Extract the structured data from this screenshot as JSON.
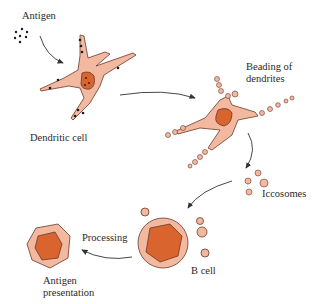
{
  "labels": {
    "antigen": "Antigen",
    "dendritic_cell": "Dendritic cell",
    "beading_line1": "Beading of",
    "beading_line2": "dendrites",
    "iccosomes": "Iccosomes",
    "b_cell": "B cell",
    "processing": "Processing",
    "antigen_presentation_line1": "Antigen",
    "antigen_presentation_line2": "presentation"
  },
  "colors": {
    "cytoplasm": "#f2b8a0",
    "nucleus": "#d9642e",
    "outline": "#6b3a2a",
    "antigen_dot": "#1a1a1a",
    "arrow": "#333333"
  }
}
